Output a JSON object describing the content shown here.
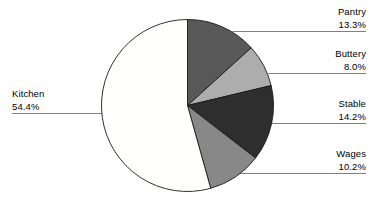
{
  "chart_data": {
    "type": "pie",
    "title": "",
    "categories": [
      "Pantry",
      "Buttery",
      "Stable",
      "Wages",
      "Kitchen"
    ],
    "values": [
      13.3,
      8.0,
      14.2,
      10.2,
      54.4
    ],
    "value_unit": "%",
    "start_angle_deg": 0,
    "direction": "clockwise",
    "legend": "none",
    "grid": false,
    "slices": [
      {
        "label": "Pantry",
        "percent_text": "13.3%",
        "value": 13.3,
        "color": "#595959"
      },
      {
        "label": "Buttery",
        "percent_text": "8.0%",
        "value": 8.0,
        "color": "#adadad"
      },
      {
        "label": "Stable",
        "percent_text": "14.2%",
        "value": 14.2,
        "color": "#2e2e2e"
      },
      {
        "label": "Wages",
        "percent_text": "10.2%",
        "value": 10.2,
        "color": "#888888"
      },
      {
        "label": "Kitchen",
        "percent_text": "54.4%",
        "value": 54.4,
        "color": "#fefefc"
      }
    ]
  },
  "colors": {
    "outline": "#1a1a1a",
    "leader_line": "#808080",
    "background": "#ffffff",
    "text": "#000000"
  },
  "labels": {
    "pantry": {
      "category": "Pantry",
      "percent": "13.3%"
    },
    "buttery": {
      "category": "Buttery",
      "percent": "8.0%"
    },
    "stable": {
      "category": "Stable",
      "percent": "14.2%"
    },
    "wages": {
      "category": "Wages",
      "percent": "10.2%"
    },
    "kitchen": {
      "category": "Kitchen",
      "percent": "54.4%"
    }
  }
}
